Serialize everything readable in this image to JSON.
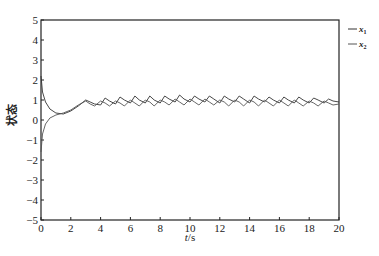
{
  "chart_data": {
    "type": "line",
    "title": "",
    "xlabel": "t/s",
    "ylabel": "状态",
    "xlim": [
      0,
      20
    ],
    "ylim": [
      -5,
      5
    ],
    "xticks": [
      0,
      2,
      4,
      6,
      8,
      10,
      12,
      14,
      16,
      18,
      20
    ],
    "yticks": [
      5,
      4,
      3,
      2,
      1,
      0,
      -1,
      -2,
      -3,
      -4,
      -5
    ],
    "grid": false,
    "legend_position": "outside-right-top",
    "series": [
      {
        "name": "x1",
        "label_base": "x",
        "label_sub": "1",
        "color": "#333333",
        "x": [
          0,
          0.1,
          0.3,
          0.6,
          1.0,
          1.5,
          2.0,
          2.5,
          3.0,
          3.3,
          3.6,
          4.0,
          4.3,
          4.6,
          5.0,
          5.3,
          5.6,
          6.0,
          6.3,
          6.6,
          7.0,
          7.3,
          7.6,
          8.0,
          8.3,
          8.6,
          9.0,
          9.3,
          9.6,
          10.0,
          10.3,
          10.6,
          11.0,
          11.3,
          11.6,
          12.0,
          12.3,
          12.6,
          13.0,
          13.3,
          13.6,
          14.0,
          14.3,
          14.6,
          15.0,
          15.3,
          15.6,
          16.0,
          16.3,
          16.6,
          17.0,
          17.3,
          17.6,
          18.0,
          18.3,
          18.6,
          19.0,
          19.3,
          19.6,
          20.0
        ],
        "y": [
          2.2,
          1.4,
          0.9,
          0.55,
          0.35,
          0.3,
          0.45,
          0.7,
          1.0,
          0.9,
          0.8,
          0.75,
          1.1,
          0.95,
          0.8,
          1.15,
          1.0,
          0.85,
          1.2,
          1.0,
          0.85,
          1.2,
          1.0,
          0.85,
          1.2,
          1.05,
          0.9,
          1.25,
          1.05,
          0.9,
          1.2,
          1.05,
          0.9,
          1.2,
          1.05,
          0.85,
          1.2,
          1.05,
          0.9,
          1.2,
          1.05,
          0.85,
          1.2,
          1.05,
          0.9,
          1.15,
          1.0,
          0.85,
          1.15,
          1.0,
          0.85,
          1.15,
          1.0,
          0.85,
          1.1,
          1.0,
          0.85,
          1.05,
          0.95,
          0.9
        ]
      },
      {
        "name": "x2",
        "label_base": "x",
        "label_sub": "2",
        "color": "#555555",
        "x": [
          0,
          0.1,
          0.3,
          0.6,
          1.0,
          1.5,
          2.0,
          2.5,
          3.0,
          3.3,
          3.6,
          4.0,
          4.3,
          4.6,
          5.0,
          5.3,
          5.6,
          6.0,
          6.3,
          6.6,
          7.0,
          7.3,
          7.6,
          8.0,
          8.3,
          8.6,
          9.0,
          9.3,
          9.6,
          10.0,
          10.3,
          10.6,
          11.0,
          11.3,
          11.6,
          12.0,
          12.3,
          12.6,
          13.0,
          13.3,
          13.6,
          14.0,
          14.3,
          14.6,
          15.0,
          15.3,
          15.6,
          16.0,
          16.3,
          16.6,
          17.0,
          17.3,
          17.6,
          18.0,
          18.3,
          18.6,
          19.0,
          19.3,
          19.6,
          20.0
        ],
        "y": [
          -1.6,
          -0.7,
          -0.2,
          0.1,
          0.25,
          0.35,
          0.5,
          0.75,
          0.95,
          0.8,
          0.7,
          0.95,
          0.85,
          0.7,
          0.95,
          0.85,
          0.7,
          1.0,
          0.85,
          0.7,
          1.0,
          0.9,
          0.7,
          1.0,
          0.9,
          0.75,
          1.05,
          0.9,
          0.75,
          1.05,
          0.9,
          0.75,
          1.05,
          0.9,
          0.75,
          1.0,
          0.9,
          0.7,
          1.0,
          0.9,
          0.7,
          1.0,
          0.9,
          0.7,
          1.0,
          0.85,
          0.7,
          1.0,
          0.85,
          0.7,
          1.0,
          0.85,
          0.7,
          0.95,
          0.85,
          0.7,
          0.95,
          0.85,
          0.75,
          0.8
        ]
      }
    ]
  },
  "layout": {
    "plot_left": 41,
    "plot_right": 339,
    "plot_top": 20,
    "plot_bottom": 220
  }
}
